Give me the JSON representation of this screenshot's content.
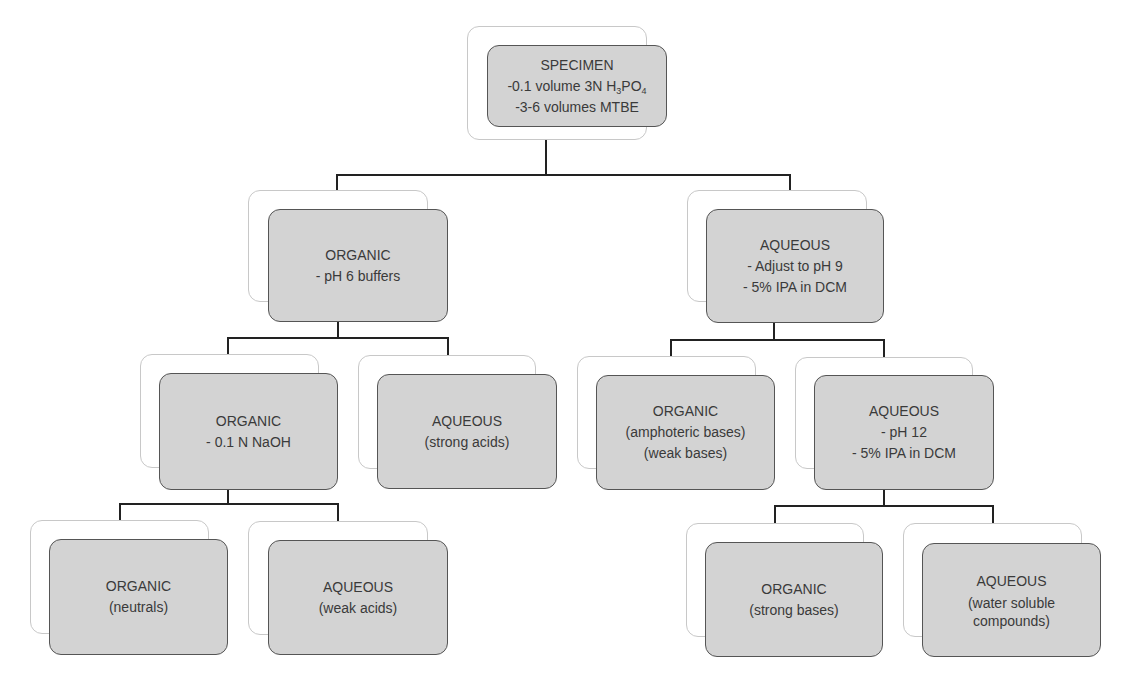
{
  "diagram": {
    "type": "tree-flowchart",
    "colors": {
      "box_fill": "#d3d3d3",
      "box_border": "#555555",
      "shadow_box_border": "#c8c8c8",
      "connector": "#222222",
      "text": "#3a3a3a"
    },
    "nodes": {
      "specimen": {
        "title": "SPECIMEN",
        "line1_prefix": "-0.1 volume 3N H",
        "line1_sub1": "3",
        "line1_mid": "PO",
        "line1_sub2": "4",
        "line2": "-3-6 volumes MTBE"
      },
      "organic_1": {
        "title": "ORGANIC",
        "line1": "- pH 6 buffers"
      },
      "aqueous_1": {
        "title": "AQUEOUS",
        "line1": "- Adjust to pH 9",
        "line2": "- 5% IPA in DCM"
      },
      "organic_2": {
        "title": "ORGANIC",
        "line1": "- 0.1 N NaOH"
      },
      "aqueous_2": {
        "title": "AQUEOUS",
        "line1": "(strong acids)"
      },
      "organic_3": {
        "title": "ORGANIC",
        "line1": "(amphoteric bases)",
        "line2": "(weak bases)"
      },
      "aqueous_3": {
        "title": "AQUEOUS",
        "line1": "- pH 12",
        "line2": "- 5% IPA in DCM"
      },
      "organic_4": {
        "title": "ORGANIC",
        "line1": "(neutrals)"
      },
      "aqueous_4": {
        "title": "AQUEOUS",
        "line1": "(weak acids)"
      },
      "organic_5": {
        "title": "ORGANIC",
        "line1": "(strong bases)"
      },
      "aqueous_5": {
        "title": "AQUEOUS",
        "line1": "(water soluble compounds)"
      }
    },
    "edges": [
      [
        "specimen",
        "organic_1"
      ],
      [
        "specimen",
        "aqueous_1"
      ],
      [
        "organic_1",
        "organic_2"
      ],
      [
        "organic_1",
        "aqueous_2"
      ],
      [
        "aqueous_1",
        "organic_3"
      ],
      [
        "aqueous_1",
        "aqueous_3"
      ],
      [
        "organic_2",
        "organic_4"
      ],
      [
        "organic_2",
        "aqueous_4"
      ],
      [
        "aqueous_3",
        "organic_5"
      ],
      [
        "aqueous_3",
        "aqueous_5"
      ]
    ]
  }
}
